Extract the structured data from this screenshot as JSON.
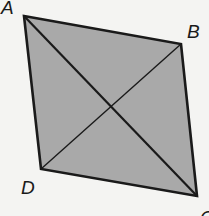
{
  "diagram": {
    "type": "quadrilateral-with-diagonals",
    "fill_color": "#a9a9a9",
    "stroke_color": "#1a1a1a",
    "background": "#f4f4f2",
    "vertices": [
      {
        "name": "A",
        "x": 24,
        "y": 16,
        "label_x": 1,
        "label_y": 14
      },
      {
        "name": "B",
        "x": 181,
        "y": 44,
        "label_x": 187,
        "label_y": 38
      },
      {
        "name": "C",
        "x": 197,
        "y": 196,
        "label_x": 200,
        "label_y": 222
      },
      {
        "name": "D",
        "x": 41,
        "y": 169,
        "label_x": 21,
        "label_y": 194
      }
    ],
    "diagonals": [
      [
        "A",
        "C"
      ],
      [
        "B",
        "D"
      ]
    ],
    "labels": {
      "A": "A",
      "B": "B",
      "C": "C",
      "D": "D"
    }
  }
}
